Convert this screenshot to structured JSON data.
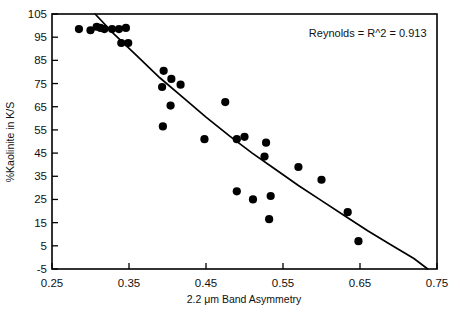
{
  "chart_data": {
    "type": "scatter",
    "title": "",
    "xlabel": "2.2 μm Band Asymmetry",
    "ylabel": "%Kaolinite in K/S",
    "xlim": [
      0.25,
      0.75
    ],
    "ylim": [
      -5,
      105
    ],
    "xticks": [
      0.25,
      0.35,
      0.45,
      0.55,
      0.65,
      0.75
    ],
    "xticklabels": [
      "0.25",
      "0.35",
      "0.45",
      "0.55",
      "0.65",
      "0.75"
    ],
    "yticks": [
      -5,
      5,
      15,
      25,
      35,
      45,
      55,
      65,
      75,
      85,
      95,
      105
    ],
    "yticklabels": [
      "-5",
      "5",
      "15",
      "25",
      "35",
      "45",
      "55",
      "65",
      "75",
      "85",
      "95",
      "105"
    ],
    "grid": false,
    "legend": false,
    "marker": "filled-circle",
    "marker_color": "#000000",
    "annotations": [
      {
        "text": "Reynolds = R^2 = 0.913",
        "x": 0.66,
        "y": 97,
        "align": "right"
      }
    ],
    "series": [
      {
        "name": "Kaolinite samples",
        "points": [
          {
            "x": 0.285,
            "y": 98.5
          },
          {
            "x": 0.3,
            "y": 98.0
          },
          {
            "x": 0.308,
            "y": 99.5
          },
          {
            "x": 0.313,
            "y": 99.0
          },
          {
            "x": 0.318,
            "y": 98.5
          },
          {
            "x": 0.328,
            "y": 98.5
          },
          {
            "x": 0.337,
            "y": 98.5
          },
          {
            "x": 0.346,
            "y": 99.0
          },
          {
            "x": 0.34,
            "y": 92.5
          },
          {
            "x": 0.349,
            "y": 92.5
          },
          {
            "x": 0.395,
            "y": 80.5
          },
          {
            "x": 0.393,
            "y": 73.5
          },
          {
            "x": 0.405,
            "y": 77.0
          },
          {
            "x": 0.417,
            "y": 74.5
          },
          {
            "x": 0.404,
            "y": 65.5
          },
          {
            "x": 0.394,
            "y": 56.5
          },
          {
            "x": 0.448,
            "y": 51.0
          },
          {
            "x": 0.475,
            "y": 67.0
          },
          {
            "x": 0.49,
            "y": 51.0
          },
          {
            "x": 0.5,
            "y": 52.0
          },
          {
            "x": 0.528,
            "y": 49.5
          },
          {
            "x": 0.526,
            "y": 43.5
          },
          {
            "x": 0.49,
            "y": 28.5
          },
          {
            "x": 0.511,
            "y": 25.0
          },
          {
            "x": 0.534,
            "y": 26.5
          },
          {
            "x": 0.532,
            "y": 16.5
          },
          {
            "x": 0.57,
            "y": 39.0
          },
          {
            "x": 0.6,
            "y": 33.5
          },
          {
            "x": 0.634,
            "y": 19.5
          },
          {
            "x": 0.648,
            "y": 7.0
          }
        ]
      }
    ],
    "fit_curve": {
      "name": "regression-line",
      "description": "Best-fit curve descending from upper-left to lower-right",
      "points": [
        {
          "x": 0.306,
          "y": 105.0
        },
        {
          "x": 0.33,
          "y": 96.5
        },
        {
          "x": 0.36,
          "y": 87.0
        },
        {
          "x": 0.39,
          "y": 77.5
        },
        {
          "x": 0.42,
          "y": 69.0
        },
        {
          "x": 0.45,
          "y": 60.5
        },
        {
          "x": 0.48,
          "y": 52.5
        },
        {
          "x": 0.51,
          "y": 45.0
        },
        {
          "x": 0.54,
          "y": 38.0
        },
        {
          "x": 0.57,
          "y": 31.0
        },
        {
          "x": 0.6,
          "y": 24.5
        },
        {
          "x": 0.63,
          "y": 18.0
        },
        {
          "x": 0.66,
          "y": 11.5
        },
        {
          "x": 0.69,
          "y": 5.5
        },
        {
          "x": 0.72,
          "y": -0.5
        },
        {
          "x": 0.738,
          "y": -5.0
        }
      ]
    }
  }
}
